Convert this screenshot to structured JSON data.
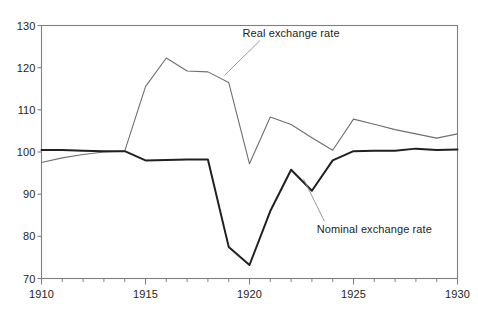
{
  "chart_data": {
    "type": "line",
    "title": "",
    "subtitle": "",
    "xlabel": "",
    "ylabel": "",
    "xlim": [
      1910,
      1930
    ],
    "ylim": [
      70,
      130
    ],
    "grid": false,
    "legend_position": "inline-annotations",
    "x_ticks_major": [
      1910,
      1915,
      1920,
      1925,
      1930
    ],
    "x_tick_labels": [
      "1910",
      "1915",
      "1920",
      "1925",
      "1930"
    ],
    "x_ticks_minor": [
      1911,
      1912,
      1913,
      1914,
      1916,
      1917,
      1918,
      1919,
      1921,
      1922,
      1923,
      1924,
      1926,
      1927,
      1928,
      1929
    ],
    "y_ticks": [
      70,
      80,
      90,
      100,
      110,
      120,
      130
    ],
    "y_tick_labels": [
      "70",
      "80",
      "90",
      "100",
      "110",
      "120",
      "130"
    ],
    "x": [
      1910,
      1911,
      1912,
      1913,
      1914,
      1915,
      1916,
      1917,
      1918,
      1919,
      1920,
      1921,
      1922,
      1923,
      1924,
      1925,
      1926,
      1927,
      1928,
      1929,
      1930
    ],
    "series": [
      {
        "name": "Real exchange rate",
        "color": "#6f6f6f",
        "width": 1.1,
        "values": [
          97.5,
          98.6,
          99.4,
          100.0,
          100.2,
          115.5,
          122.3,
          119.2,
          119.0,
          116.5,
          97.2,
          108.3,
          106.5,
          103.4,
          100.4,
          107.8,
          106.6,
          105.3,
          104.3,
          103.3,
          104.3
        ]
      },
      {
        "name": "Nominal exchange rate",
        "color": "#231f20",
        "width": 2.0,
        "values": [
          100.5,
          100.5,
          100.3,
          100.2,
          100.2,
          98.0,
          98.1,
          98.2,
          98.2,
          77.5,
          73.2,
          86.0,
          95.8,
          90.8,
          98.0,
          100.2,
          100.3,
          100.3,
          100.8,
          100.5,
          100.6
        ]
      }
    ],
    "annotations": [
      {
        "name": "real-exchange-rate-label",
        "text": "Real exchange rate",
        "x": 1922.0,
        "y": 128.2,
        "leader_from": {
          "x": 1920.5,
          "y": 126.4
        },
        "leader_to": {
          "x": 1918.8,
          "y": 118.2
        }
      },
      {
        "name": "nominal-exchange-rate-label",
        "text": "Nominal exchange rate",
        "x": 1926.0,
        "y": 81.8,
        "leader_from": {
          "x": 1923.6,
          "y": 83.6
        },
        "leader_to": {
          "x": 1922.6,
          "y": 93.6
        }
      }
    ],
    "axis_color": "#808080",
    "tick_color": "#808080",
    "text_color": "#231f20",
    "background": "#ffffff"
  }
}
